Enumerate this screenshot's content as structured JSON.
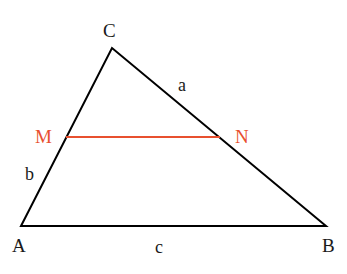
{
  "diagram": {
    "vertices": {
      "A": {
        "label": "A",
        "x": 21,
        "y": 226
      },
      "B": {
        "label": "B",
        "x": 326,
        "y": 226
      },
      "C": {
        "label": "C",
        "x": 112,
        "y": 48
      }
    },
    "points": {
      "M": {
        "label": "M",
        "x": 66,
        "y": 137
      },
      "N": {
        "label": "N",
        "x": 220,
        "y": 137
      }
    },
    "sides": {
      "a": {
        "label": "a",
        "between": "C-B"
      },
      "b": {
        "label": "b",
        "between": "A-C"
      },
      "c": {
        "label": "c",
        "between": "A-B"
      }
    },
    "colors": {
      "triangle": "#000000",
      "midsegment": "#e8502f",
      "label": "#1a1a1a",
      "highlight_label": "#e8502f"
    }
  }
}
